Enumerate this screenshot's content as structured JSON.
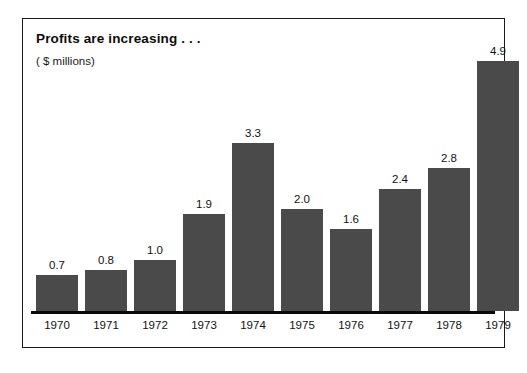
{
  "chart_data": {
    "type": "bar",
    "title": "Profits are increasing . . .",
    "subtitle": "( $ millions)",
    "xlabel": "",
    "ylabel": "",
    "categories": [
      "1970",
      "1971",
      "1972",
      "1973",
      "1974",
      "1975",
      "1976",
      "1977",
      "1978",
      "1979"
    ],
    "values": [
      0.7,
      0.8,
      1.0,
      1.9,
      3.3,
      2.0,
      1.6,
      2.4,
      2.8,
      4.9
    ],
    "value_labels": [
      "0.7",
      "0.8",
      "1.0",
      "1.9",
      "3.3",
      "2.0",
      "1.6",
      "2.4",
      "2.8",
      "4.9"
    ],
    "ylim": [
      0,
      4.9
    ],
    "grid": false,
    "legend": null,
    "bar_color": "#4a4a4a",
    "axis_color": "#0a0a0a",
    "frame_color": "#1a1a1a",
    "background_color": "#ffffff",
    "text_color": "#111111"
  }
}
